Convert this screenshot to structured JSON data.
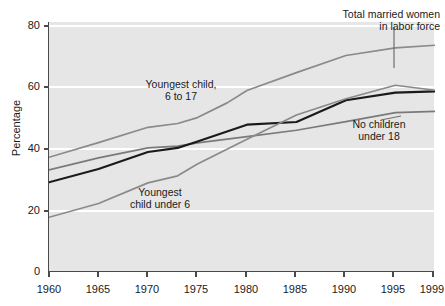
{
  "chart_data": {
    "type": "line",
    "title": "",
    "xlabel": "",
    "ylabel": "Percentage",
    "xlim": [
      1960,
      1999
    ],
    "ylim": [
      0,
      85
    ],
    "grid": true,
    "legend_position": "inline-annotations",
    "x_ticks": [
      "1960",
      "1965",
      "1970",
      "1975",
      "1980",
      "1985",
      "1990",
      "1995",
      "1999"
    ],
    "x_tick_values": [
      1960,
      1965,
      1970,
      1975,
      1980,
      1985,
      1990,
      1995,
      1999
    ],
    "y_ticks": [
      "0",
      "20",
      "40",
      "60",
      "80"
    ],
    "y_tick_values": [
      0,
      20,
      40,
      60,
      80
    ],
    "series": [
      {
        "name": "Youngest child, 6 to 17",
        "color": "#8a8a8a",
        "x": [
          1960,
          1965,
          1970,
          1973,
          1975,
          1978,
          1980,
          1985,
          1990,
          1995,
          1999
        ],
        "values": [
          39.0,
          44.0,
          49.2,
          50.5,
          52.5,
          57.5,
          61.7,
          67.8,
          73.6,
          76.2,
          77.1
        ]
      },
      {
        "name": "No children under 18",
        "color": "#7a7a7a",
        "x": [
          1960,
          1965,
          1970,
          1973,
          1975,
          1980,
          1985,
          1990,
          1995,
          1999
        ],
        "values": [
          34.7,
          38.8,
          42.2,
          42.8,
          43.9,
          46.0,
          48.2,
          51.1,
          54.2,
          54.6
        ]
      },
      {
        "name": "Total married women in labor force",
        "color": "#1a1a1a",
        "x": [
          1960,
          1965,
          1970,
          1973,
          1975,
          1980,
          1985,
          1990,
          1995,
          1999
        ],
        "values": [
          30.5,
          35.0,
          40.8,
          42.2,
          44.4,
          50.1,
          51.0,
          58.4,
          61.0,
          61.4
        ]
      },
      {
        "name": "Youngest child under 6",
        "color": "#8a8a8a",
        "x": [
          1960,
          1965,
          1970,
          1973,
          1975,
          1980,
          1985,
          1990,
          1995,
          1999
        ],
        "values": [
          18.6,
          23.3,
          30.3,
          32.7,
          36.7,
          45.1,
          53.4,
          58.9,
          63.5,
          61.8
        ]
      }
    ],
    "annotations": [
      {
        "id": "youngest-6-to-17",
        "line1": "Youngest child,",
        "line2": "6 to 17"
      },
      {
        "id": "youngest-under-6",
        "line1": "Youngest",
        "line2": "child under 6"
      },
      {
        "id": "total-married-women",
        "line1": "Total married women",
        "line2": "in labor force"
      },
      {
        "id": "no-children",
        "line1": "No children",
        "line2": "under 18"
      }
    ]
  }
}
